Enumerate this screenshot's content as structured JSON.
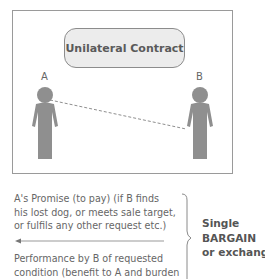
{
  "diagram": {
    "title": "Unilateral Contract",
    "party_a": "A",
    "party_b": "B",
    "promise_lines": [
      "A's Promise (to pay) (if B finds",
      "his lost dog, or meets sale target,",
      "or fulfils any other request etc.)"
    ],
    "performance_lines": [
      "Performance by B of requested",
      "condition (benefit to A and burden"
    ],
    "conclusion_lines": [
      "Single",
      "BARGAIN",
      "or exchange"
    ],
    "arrow_direction": "left",
    "colors": {
      "figure": "#8f8f8f",
      "pill_fill": "#ececec",
      "border": "#9a9a9a",
      "text": "#666666"
    }
  }
}
